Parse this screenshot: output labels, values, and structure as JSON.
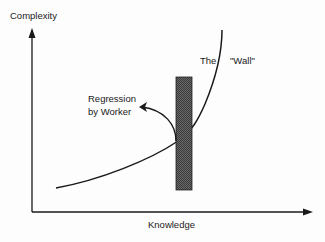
{
  "diagram": {
    "y_axis_label": "Complexity",
    "x_axis_label": "Knowledge",
    "wall_label_the": "The",
    "wall_label_wall": "\"Wall\"",
    "regression_label_line1": "Regression",
    "regression_label_line2": "by Worker",
    "colors": {
      "line": "#1a1a1a",
      "wall_fill": "#555555"
    }
  }
}
